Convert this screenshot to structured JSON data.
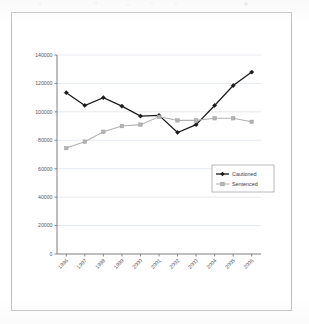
{
  "chart_data": {
    "type": "line",
    "title": "",
    "xlabel": "",
    "ylabel": "",
    "categories": [
      "1996",
      "1997",
      "1998",
      "1999",
      "2000",
      "2001",
      "2002",
      "2003",
      "2004",
      "2005",
      "2006"
    ],
    "ylim": [
      0,
      140000
    ],
    "yticks": [
      0,
      20000,
      40000,
      60000,
      80000,
      100000,
      120000,
      140000
    ],
    "ytick_labels": [
      "0",
      "20000",
      "40000",
      "60000",
      "80000",
      "100000",
      "120000",
      "140000"
    ],
    "grid": true,
    "legend_position": "right",
    "series": [
      {
        "name": "Cautioned",
        "color": "#1a1a1a",
        "marker": "diamond",
        "values": [
          113500,
          104500,
          110000,
          104000,
          97000,
          97500,
          85500,
          91000,
          104500,
          118500,
          128000
        ]
      },
      {
        "name": "Sentenced",
        "color": "#b3b3b3",
        "marker": "square",
        "values": [
          74500,
          79000,
          86000,
          90000,
          91000,
          96500,
          94000,
          94000,
          95500,
          95500,
          93000
        ]
      }
    ]
  },
  "legend": {
    "items": [
      {
        "label": "Cautioned"
      },
      {
        "label": "Sentenced"
      }
    ]
  },
  "colors": {
    "cautioned": "#1a1a1a",
    "sentenced": "#b3b3b3",
    "gridline": "#dfe3ea",
    "axis": "#6f6f74",
    "frame": "#b9b9bd",
    "text": "#58585c"
  }
}
